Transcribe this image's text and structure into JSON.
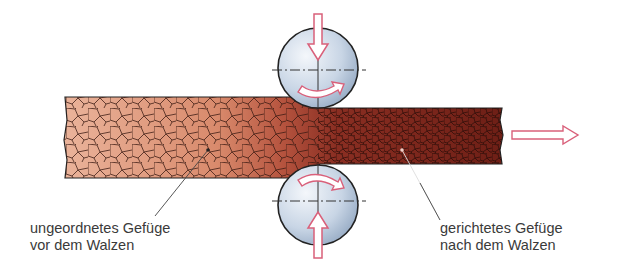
{
  "diagram": {
    "labels": {
      "left_line1": "ungeordnetes Gefüge",
      "left_line2": "vor dem Walzen",
      "right_line1": "gerichtetes Gefüge",
      "right_line2": "nach dem Walzen"
    },
    "colors": {
      "grain_light": "#e8a98c",
      "grain_dark": "#7a2418",
      "roller_fill": "#c9d6e6",
      "arrow_outline": "#d9607a",
      "outline": "#222222"
    },
    "elements": [
      "upper-roller",
      "lower-roller",
      "workpiece-strip",
      "feed-direction-arrow",
      "pressure-arrows",
      "rotation-arrows"
    ]
  }
}
